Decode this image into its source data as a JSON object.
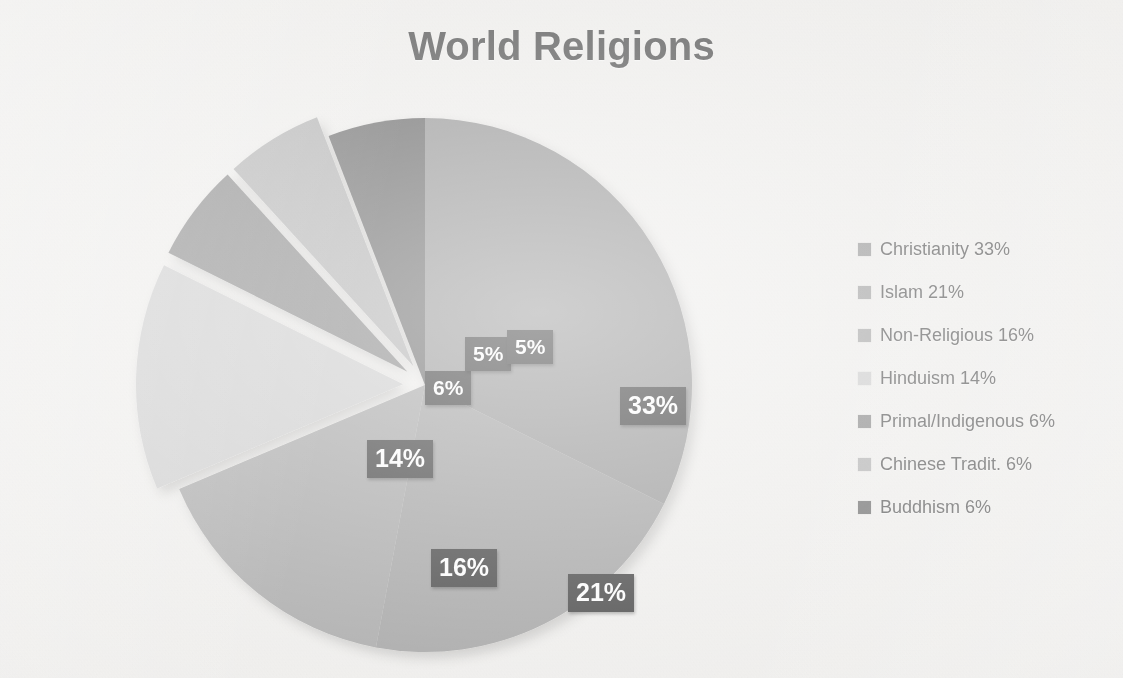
{
  "title": "World Religions",
  "background_color": "#f1f0ee",
  "title_color": "#595959",
  "label_box_color": "#3f3f3f",
  "label_text_color": "#ffffff",
  "chart_data": {
    "type": "pie",
    "title": "World Religions",
    "xlabel": "",
    "ylabel": "",
    "legend_position": "right",
    "grid": false,
    "start_angle_deg": 0,
    "direction": "clockwise",
    "units": "percent",
    "categories": [
      "Christianity",
      "Islam",
      "Non-Religious",
      "Hinduism",
      "Primal/Indigenous",
      "Chinese Tradit.",
      "Buddhism"
    ],
    "values": [
      33,
      21,
      16,
      14,
      6,
      6,
      6
    ],
    "slice_label_values": [
      "33%",
      "21%",
      "16%",
      "14%",
      "6%",
      "5%",
      "5%"
    ],
    "colors": [
      "#9a9a9a",
      "#a3a3a3",
      "#a8a8a8",
      "#cfcfcf",
      "#8a8a8a",
      "#b4b4b4",
      "#6e6e6e"
    ],
    "exploded": [
      false,
      false,
      false,
      true,
      true,
      true,
      false
    ],
    "legend_entries": [
      {
        "label": "Christianity 33%",
        "color": "#9a9a9a"
      },
      {
        "label": "Islam 21%",
        "color": "#a3a3a3"
      },
      {
        "label": "Non-Religious 16%",
        "color": "#a8a8a8"
      },
      {
        "label": "Hinduism 14%",
        "color": "#cfcfcf"
      },
      {
        "label": "Primal/Indigenous 6%",
        "color": "#8a8a8a"
      },
      {
        "label": "Chinese Tradit. 6%",
        "color": "#b4b4b4"
      },
      {
        "label": "Buddhism 6%",
        "color": "#6e6e6e"
      }
    ]
  },
  "slice_labels": [
    {
      "text": "33%",
      "x": 500,
      "y": 295,
      "size": "big"
    },
    {
      "text": "21%",
      "x": 448,
      "y": 482,
      "size": "big"
    },
    {
      "text": "16%",
      "x": 311,
      "y": 457,
      "size": "big"
    },
    {
      "text": "14%",
      "x": 247,
      "y": 348,
      "size": "big"
    },
    {
      "text": "6%",
      "x": 305,
      "y": 279,
      "size": "small"
    },
    {
      "text": "5%",
      "x": 345,
      "y": 245,
      "size": "small"
    },
    {
      "text": "5%",
      "x": 387,
      "y": 238,
      "size": "small"
    }
  ],
  "pie_geometry": {
    "center_x": 305,
    "center_y": 293,
    "radius": 267,
    "explode_offset": 22
  }
}
